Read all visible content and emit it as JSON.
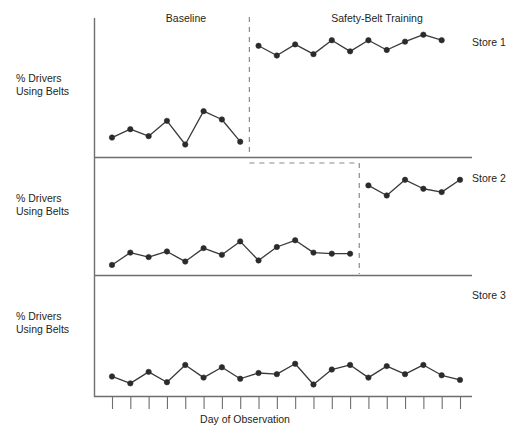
{
  "figure": {
    "phases": [
      {
        "id": "baseline",
        "label": "Baseline"
      },
      {
        "id": "training",
        "label": "Safety-Belt Training"
      }
    ],
    "y_axis_labels": [
      "% Drivers\nUsing Belts",
      "% Drivers\nUsing Belts",
      "% Drivers\nUsing Belts"
    ],
    "x_axis_label": "Day of Observation",
    "series_labels": [
      "Store 1",
      "Store 2",
      "Store 3"
    ],
    "footer_fragment": "",
    "colors": {
      "ink": "#231f20",
      "axis": "#6e6e6e",
      "marker": "#2b2b2b",
      "line": "#3a3a3a",
      "dashed": "#8a8a8a",
      "background": "#ffffff"
    }
  },
  "chart_data": {
    "type": "line",
    "title": "",
    "subtitle": "",
    "xlabel": "Day of Observation",
    "ylabel": "% Drivers Using Belts",
    "grid": false,
    "legend_position": "right",
    "design": "multiple-baseline across settings",
    "x": [
      1,
      2,
      3,
      4,
      5,
      6,
      7,
      8,
      9,
      10,
      11,
      12,
      13,
      14,
      15,
      16,
      17,
      18,
      19,
      20
    ],
    "xlim": [
      1,
      20
    ],
    "ylim": [
      0,
      100
    ],
    "tick_count": 20,
    "annotations": [
      {
        "text": "Baseline",
        "phase": "baseline"
      },
      {
        "text": "Safety-Belt Training",
        "phase": "training"
      }
    ],
    "panels": [
      {
        "name": "Store 1",
        "intervention_after_x": 8,
        "series": [
          {
            "name": "Baseline",
            "phase": "baseline",
            "x": [
              1,
              2,
              3,
              4,
              5,
              6,
              7,
              8
            ],
            "values": [
              14,
              20,
              15,
              26,
              9,
              33,
              27,
              11
            ]
          },
          {
            "name": "Safety-Belt Training",
            "phase": "training",
            "x": [
              9,
              10,
              11,
              12,
              13,
              14,
              15,
              16,
              17,
              18,
              19
            ],
            "values": [
              80,
              73,
              81,
              74,
              84,
              76,
              84,
              77,
              83,
              88,
              84
            ]
          }
        ]
      },
      {
        "name": "Store 2",
        "intervention_after_x": 14,
        "series": [
          {
            "name": "Baseline",
            "phase": "baseline",
            "x": [
              1,
              2,
              3,
              4,
              5,
              6,
              7,
              8,
              9,
              10,
              11,
              12,
              13,
              14
            ],
            "values": [
              9,
              20,
              16,
              21,
              12,
              24,
              18,
              30,
              13,
              25,
              31,
              20,
              19,
              19
            ]
          },
          {
            "name": "Safety-Belt Training",
            "phase": "training",
            "x": [
              15,
              16,
              17,
              18,
              19,
              20
            ],
            "values": [
              80,
              71,
              85,
              77,
              74,
              85
            ]
          }
        ]
      },
      {
        "name": "Store 3",
        "intervention_after_x": null,
        "series": [
          {
            "name": "Baseline",
            "phase": "baseline",
            "x": [
              1,
              2,
              3,
              4,
              5,
              6,
              7,
              8,
              9,
              10,
              11,
              12,
              13,
              14,
              15,
              16,
              17,
              18,
              19,
              20
            ],
            "values": [
              17,
              11,
              21,
              12,
              27,
              16,
              25,
              15,
              20,
              19,
              28,
              10,
              23,
              27,
              16,
              26,
              19,
              27,
              18,
              14
            ]
          }
        ]
      }
    ]
  }
}
